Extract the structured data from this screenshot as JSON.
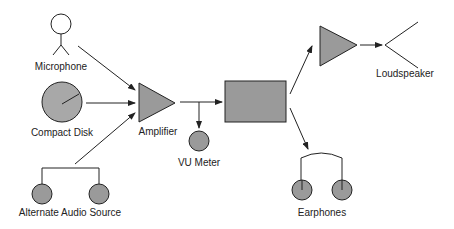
{
  "colors": {
    "fill": "#9a9a9a",
    "stroke": "#222222",
    "background": "#ffffff"
  },
  "nodes": {
    "microphone": {
      "label": "Microphone",
      "icon": "stick-figure-microphone-icon"
    },
    "compact_disk": {
      "label": "Compact Disk",
      "icon": "disc-icon"
    },
    "alternate_audio_source": {
      "label": "Alternate Audio Source",
      "icon": "headset-source-icon"
    },
    "amplifier": {
      "label": "Amplifier",
      "icon": "triangle-amplifier-icon"
    },
    "vu_meter": {
      "label": "VU Meter",
      "icon": "circle-meter-icon"
    },
    "processor": {
      "label": "",
      "icon": "rectangle-box-icon"
    },
    "power_amplifier": {
      "label": "",
      "icon": "triangle-amplifier-icon"
    },
    "loudspeaker": {
      "label": "Loudspeaker",
      "icon": "speaker-cone-icon"
    },
    "earphones": {
      "label": "Earphones",
      "icon": "earphones-icon"
    }
  },
  "edges": [
    {
      "from": "microphone",
      "to": "amplifier"
    },
    {
      "from": "compact_disk",
      "to": "amplifier"
    },
    {
      "from": "alternate_audio_source",
      "to": "amplifier"
    },
    {
      "from": "amplifier",
      "to": "processor"
    },
    {
      "from": "amplifier",
      "to": "vu_meter"
    },
    {
      "from": "processor",
      "to": "power_amplifier"
    },
    {
      "from": "power_amplifier",
      "to": "loudspeaker"
    },
    {
      "from": "processor",
      "to": "earphones"
    }
  ]
}
